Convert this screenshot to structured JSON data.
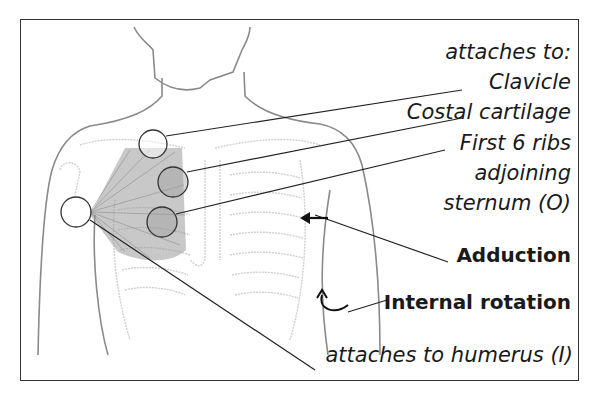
{
  "diagram": {
    "labels": {
      "origin_header": "attaches to:",
      "origin_1": "Clavicle",
      "origin_2": "Costal cartilage",
      "origin_3a": "First 6 ribs",
      "origin_3b": "adjoining",
      "origin_3c": "sternum (O)",
      "action_1": "Adduction",
      "action_2": "Internal rotation",
      "insertion": "attaches to humerus (I)"
    },
    "colors": {
      "outline": "#7a7a7a",
      "skeleton": "#c8c8c8",
      "muscle": "#8a8a8a",
      "line": "#222222"
    }
  }
}
